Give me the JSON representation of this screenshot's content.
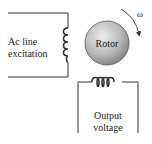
{
  "diagram": {
    "labels": {
      "input": [
        "Ac line",
        "excitation"
      ],
      "rotor": "Rotor",
      "output": [
        "Output",
        "voltage"
      ],
      "omega": "ω"
    },
    "colors": {
      "wire": "#333333",
      "rotor_fill_light": "#e6e6e6",
      "rotor_fill_dark": "#8c8c8c",
      "text": "#222222"
    }
  }
}
